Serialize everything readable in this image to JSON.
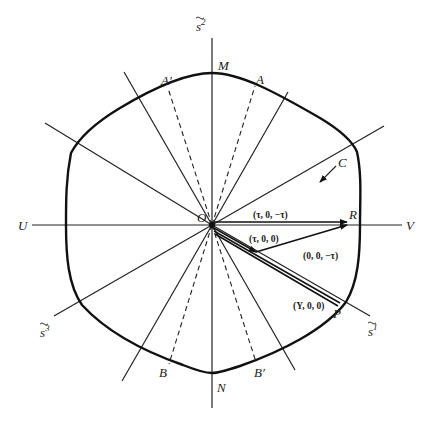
{
  "figure": {
    "origin_label": "O",
    "curve_label": "C",
    "axes": {
      "s2": {
        "base": "s",
        "sup": "2"
      },
      "s1": {
        "base": "s",
        "sup": "1"
      },
      "s3": {
        "base": "s",
        "sup": "3"
      },
      "U": "U",
      "V": "V"
    },
    "points": {
      "M": "M",
      "N": "N",
      "A": "A",
      "A_prime": "A′",
      "B": "B",
      "B_prime": "B′",
      "R": "R",
      "P": "P"
    },
    "vector_labels": {
      "tau_0_minus_tau": "(τ, 0, −τ)",
      "tau_0_0": "(τ, 0, 0)",
      "zero_0_minus_tau": "(0, 0, −τ)",
      "Y_0_0": "(Y, 0, 0)"
    },
    "colors": {
      "line": "#222222",
      "background": "#ffffff"
    }
  }
}
